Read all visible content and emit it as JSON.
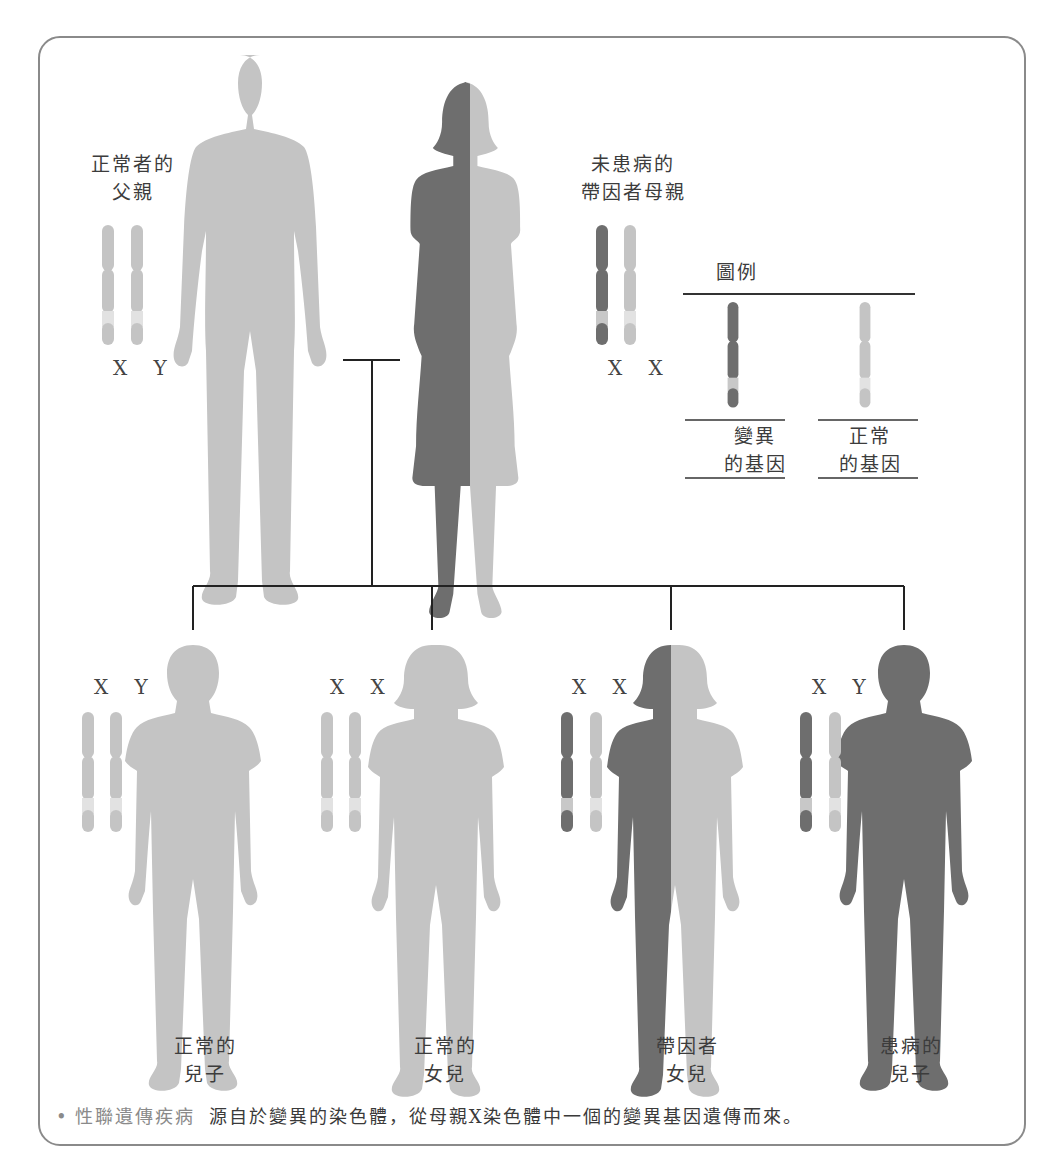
{
  "colors": {
    "normal": "#c4c4c4",
    "mutant": "#6e6e6e",
    "band": "#e2e2e2",
    "line": "#222222",
    "frame": "#8a8a8a"
  },
  "parents": {
    "father": {
      "label_line1": "正常者的",
      "label_line2": "父親",
      "chromosomes": "X Y",
      "x_type": "normal",
      "y_type": "normal"
    },
    "mother": {
      "label_line1": "未患病的",
      "label_line2": "帶因者母親",
      "chromosomes": "X X",
      "x1_type": "mutant",
      "x2_type": "normal"
    }
  },
  "legend": {
    "title": "圖例",
    "items": [
      {
        "line1": "變異",
        "line2": "的基因",
        "type": "mutant"
      },
      {
        "line1": "正常",
        "line2": "的基因",
        "type": "normal"
      }
    ]
  },
  "children": [
    {
      "chromosomes": "X Y",
      "label_line1": "正常的",
      "label_line2": "兒子",
      "status": "normal"
    },
    {
      "chromosomes": "X X",
      "label_line1": "正常的",
      "label_line2": "女兒",
      "status": "normal"
    },
    {
      "chromosomes": "X X",
      "label_line1": "帶因者",
      "label_line2": "女兒",
      "status": "carrier"
    },
    {
      "chromosomes": "X Y",
      "label_line1": "患病的",
      "label_line2": "兒子",
      "status": "affected"
    }
  ],
  "caption": {
    "term": "性聯遺傳疾病",
    "text": "源自於變異的染色體，從母親X染色體中一個的變異基因遺傳而來。"
  }
}
